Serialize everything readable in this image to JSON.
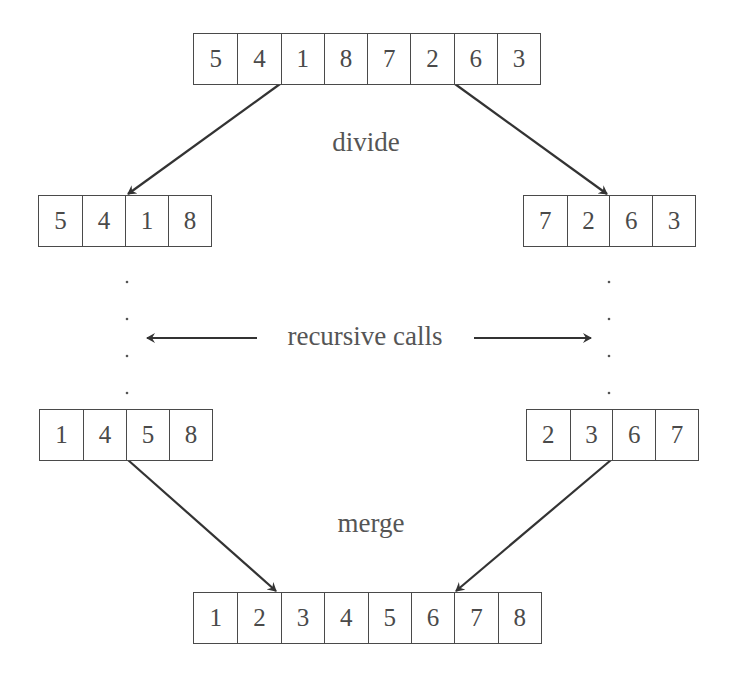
{
  "diagram": {
    "labels": {
      "divide": "divide",
      "recursive": "recursive calls",
      "merge": "merge"
    },
    "arrays": {
      "input": [
        "5",
        "4",
        "1",
        "8",
        "7",
        "2",
        "6",
        "3"
      ],
      "left_half": [
        "5",
        "4",
        "1",
        "8"
      ],
      "right_half": [
        "7",
        "2",
        "6",
        "3"
      ],
      "left_sorted": [
        "1",
        "4",
        "5",
        "8"
      ],
      "right_sorted": [
        "2",
        "3",
        "6",
        "7"
      ],
      "output": [
        "1",
        "2",
        "3",
        "4",
        "5",
        "6",
        "7",
        "8"
      ]
    },
    "colors": {
      "line": "#3a3a3a",
      "text": "#555555",
      "box_border": "#4a4a4a"
    }
  }
}
